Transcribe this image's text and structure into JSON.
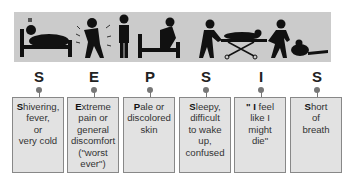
{
  "diagram": {
    "title_letters": [
      "S",
      "E",
      "P",
      "S",
      "I",
      "S"
    ],
    "items": [
      {
        "letter": "S",
        "lead": "S",
        "rest_lines": [
          "hivering,",
          "fever,",
          "or",
          "very cold"
        ],
        "text": "Shivering, fever, or very cold",
        "icon": "person-in-bed-shivering-icon"
      },
      {
        "letter": "E",
        "lead": "E",
        "rest_lines": [
          "xtreme",
          "pain or",
          "general",
          "discomfort",
          "(\"worst",
          "ever\")"
        ],
        "text": "Extreme pain or general discomfort (\"worst ever\")",
        "icon": "person-in-pain-icon"
      },
      {
        "letter": "P",
        "lead": "P",
        "rest_lines": [
          "ale or",
          "discolored",
          "skin"
        ],
        "text": "Pale or discolored skin",
        "icon": "person-sitting-on-bed-icon"
      },
      {
        "letter": "S",
        "lead": "S",
        "rest_lines": [
          "leepy,",
          "difficult",
          "to wake",
          "up,",
          "confused"
        ],
        "text": "Sleepy, difficult to wake up, confused",
        "icon": "patient-on-stretcher-icon"
      },
      {
        "letter": "I",
        "lead": "\" I",
        "rest_lines": [
          " feel",
          "like I",
          "might",
          "die\""
        ],
        "text": "\" I feel like I might die\"",
        "icon": "person-pushing-stretcher-icon"
      },
      {
        "letter": "S",
        "lead": "S",
        "rest_lines": [
          "hort",
          "of",
          "breath"
        ],
        "text": "Short of breath",
        "icon": "person-collapsed-icon"
      }
    ],
    "colors": {
      "banner": "#cbcbcb",
      "box_fill": "#e2e2e2",
      "box_border": "#888888",
      "connector": "#777777",
      "text": "#333333"
    }
  }
}
